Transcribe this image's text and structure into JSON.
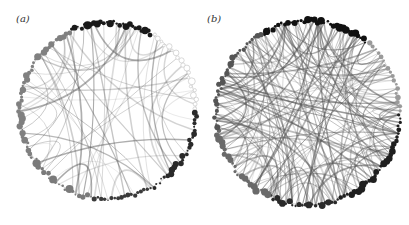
{
  "figure": {
    "panels": [
      {
        "id": "a",
        "label": "(a)",
        "center": [
          108,
          111
        ],
        "radius": 88,
        "edge_count": 60,
        "edge_opacity_range": [
          0.15,
          0.5
        ],
        "seed": 7,
        "node_groups": [
          {
            "from_deg": -115,
            "to_deg": -60,
            "color": "#1a1a1a",
            "count": 26,
            "max_r": 4.2
          },
          {
            "from_deg": -60,
            "to_deg": 0,
            "color": "#cfcfcf",
            "count": 20,
            "max_r": 3.6,
            "hollow": true
          },
          {
            "from_deg": 0,
            "to_deg": 60,
            "color": "#2a2a2a",
            "count": 26,
            "max_r": 3.2
          },
          {
            "from_deg": 60,
            "to_deg": 100,
            "color": "#3a3a3a",
            "count": 18,
            "max_r": 2.6
          },
          {
            "from_deg": 100,
            "to_deg": 150,
            "color": "#7a7a7a",
            "count": 20,
            "max_r": 4.2
          },
          {
            "from_deg": 150,
            "to_deg": 245,
            "color": "#808080",
            "count": 40,
            "max_r": 3.6
          }
        ]
      },
      {
        "id": "b",
        "label": "(b)",
        "center": [
          308,
          113
        ],
        "radius": 92,
        "edge_count": 170,
        "edge_opacity_range": [
          0.2,
          0.6
        ],
        "seed": 19,
        "node_groups": [
          {
            "from_deg": -120,
            "to_deg": -50,
            "color": "#111111",
            "count": 34,
            "max_r": 4.2
          },
          {
            "from_deg": -50,
            "to_deg": 0,
            "color": "#9a9a9a",
            "count": 18,
            "max_r": 2.8
          },
          {
            "from_deg": 0,
            "to_deg": 70,
            "color": "#1f1f1f",
            "count": 30,
            "max_r": 3.8
          },
          {
            "from_deg": 70,
            "to_deg": 115,
            "color": "#2a2a2a",
            "count": 22,
            "max_r": 3.6
          },
          {
            "from_deg": 115,
            "to_deg": 170,
            "color": "#6a6a6a",
            "count": 22,
            "max_r": 3.8
          },
          {
            "from_deg": 170,
            "to_deg": 240,
            "color": "#555555",
            "count": 34,
            "max_r": 3.2
          }
        ]
      }
    ]
  }
}
